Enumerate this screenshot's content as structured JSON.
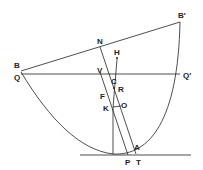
{
  "diagram": {
    "type": "geometric construction (parabola)",
    "labels": {
      "B": "B",
      "B_prime": "B′",
      "Q": "Q",
      "Q_prime": "Q′",
      "N": "N",
      "H": "H",
      "V": "V",
      "C": "C",
      "R": "R",
      "F": "F",
      "K": "K",
      "O": "O",
      "A": "A",
      "P": "P",
      "T": "T"
    },
    "colors": {
      "stroke": "#222222",
      "background": "#ffffff"
    }
  }
}
